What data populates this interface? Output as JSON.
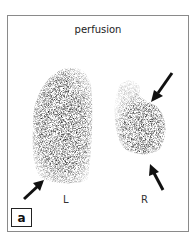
{
  "figure": {
    "title": "perfusion",
    "panel_label": "a",
    "lung_labels": {
      "left": "L",
      "right": "R"
    },
    "arrows": [
      {
        "name": "arrow-left-lower",
        "target": "left lung base"
      },
      {
        "name": "arrow-right-upper",
        "target": "right lung upper defect"
      },
      {
        "name": "arrow-right-lower",
        "target": "right lung base"
      }
    ]
  }
}
